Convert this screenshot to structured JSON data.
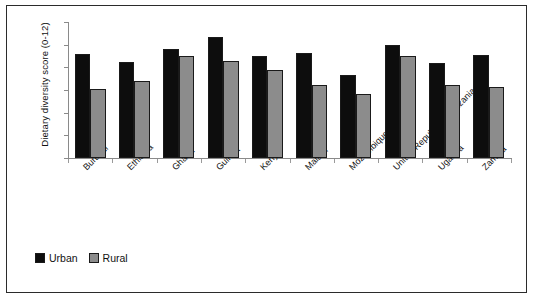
{
  "chart_data": {
    "type": "bar",
    "title": "",
    "xlabel": "",
    "ylabel": "Dietary diversity score (0-12)",
    "ylim": [
      0,
      12
    ],
    "yticks": [
      0,
      2,
      4,
      6,
      8,
      10,
      12
    ],
    "grid": false,
    "legend_position": "bottom-left",
    "categories": [
      "Burundi",
      "Ethiopia",
      "Ghana",
      "Guinea",
      "Kenya",
      "Malawi",
      "Mozambique",
      "United Republic of Tanzania",
      "Uganda",
      "Zambia"
    ],
    "series": [
      {
        "name": "Urban",
        "color": "#0d0d0d",
        "values": [
          9.2,
          8.5,
          9.6,
          10.7,
          9.0,
          9.25,
          7.3,
          10.0,
          8.35,
          9.05
        ]
      },
      {
        "name": "Rural",
        "color": "#8c8c8c",
        "values": [
          6.1,
          6.8,
          9.0,
          8.6,
          7.8,
          6.4,
          5.65,
          9.0,
          6.45,
          6.3
        ]
      }
    ]
  }
}
